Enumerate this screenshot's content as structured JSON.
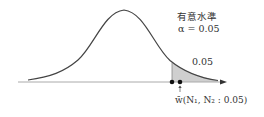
{
  "diagram": {
    "type": "normal-distribution-right-tail",
    "significance_title": "有意水準",
    "alpha_label": "α = 0.05",
    "tail_area_label": "0.05",
    "critical_value_label": "w̄(N₁, N₂ : 0.05)",
    "colors": {
      "curve": "#444444",
      "axis": "#999999",
      "shade": "#cfcfcf",
      "dot": "#111111",
      "text": "#333333"
    }
  }
}
